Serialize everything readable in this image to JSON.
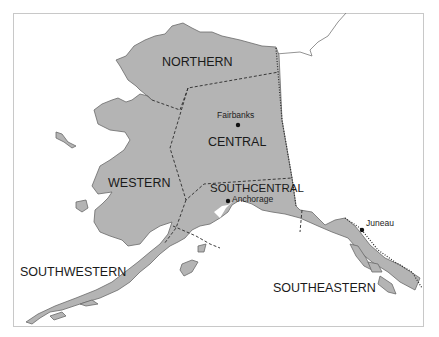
{
  "map": {
    "title": "Alaska regions",
    "colors": {
      "land": "#b4b4b4",
      "coast": "#6a6a6a",
      "water": "#ffffff",
      "boundary": "#2a2a2a"
    },
    "regions": [
      {
        "name": "NORTHERN"
      },
      {
        "name": "CENTRAL"
      },
      {
        "name": "WESTERN"
      },
      {
        "name": "SOUTHCENTRAL"
      },
      {
        "name": "SOUTHWESTERN"
      },
      {
        "name": "SOUTHEASTERN"
      }
    ],
    "cities": [
      {
        "name": "Fairbanks"
      },
      {
        "name": "Anchorage"
      },
      {
        "name": "Juneau"
      }
    ]
  }
}
